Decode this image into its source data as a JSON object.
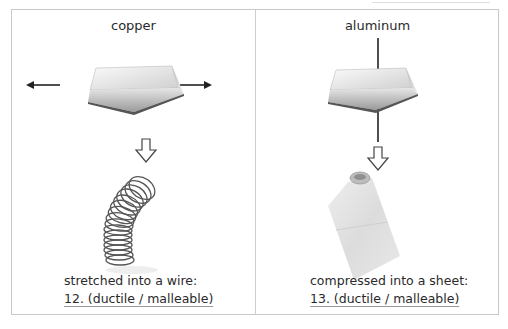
{
  "worksheet": {
    "panels": [
      {
        "metal": "copper",
        "process_icon": "stretch-arrows-icon",
        "result_image": "coiled-wire-spring",
        "caption": "stretched into a wire:",
        "question_number": "12.",
        "answer_choices": "(ductile / malleable)",
        "answer_line": "12. (ductile / malleable)"
      },
      {
        "metal": "aluminum",
        "process_icon": "compress-arrows-icon",
        "result_image": "rolled-foil-sheet",
        "caption": "compressed into a sheet:",
        "question_number": "13.",
        "answer_choices": "(ductile / malleable)",
        "answer_line": "13. (ductile / malleable)"
      }
    ],
    "colors": {
      "border": "#c9c9c9",
      "text": "#2a2a2a",
      "arrow": "#222222",
      "metal_light": "#f2f2f2",
      "metal_dark": "#8a8a8a"
    }
  }
}
